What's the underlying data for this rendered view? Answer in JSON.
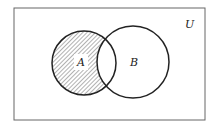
{
  "diagram": {
    "type": "venn",
    "universe_label": "U",
    "sets": [
      {
        "label": "A",
        "shaded": "A minus B"
      },
      {
        "label": "B",
        "shaded": "none"
      }
    ],
    "shaded_region": "A \\ B",
    "colors": {
      "stroke": "#222222",
      "hatch": "#555555",
      "background": "#ffffff"
    }
  }
}
